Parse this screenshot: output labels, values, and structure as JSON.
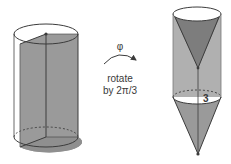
{
  "diagram": {
    "left_figure": {
      "type": "cylinder-with-shaded-wedge",
      "description": "Cylinder with a shaded wedge section through the central axis"
    },
    "transform": {
      "symbol": "φ",
      "line1": "rotate",
      "line2": "by 2π/3"
    },
    "right_figure": {
      "type": "cylinder-with-cones",
      "label": "3"
    },
    "colors": {
      "shade": "#9a9a9a",
      "shade_dark": "#7d7d7d",
      "stroke": "#3c3c3c",
      "light_stroke": "#8a8a8a"
    }
  }
}
